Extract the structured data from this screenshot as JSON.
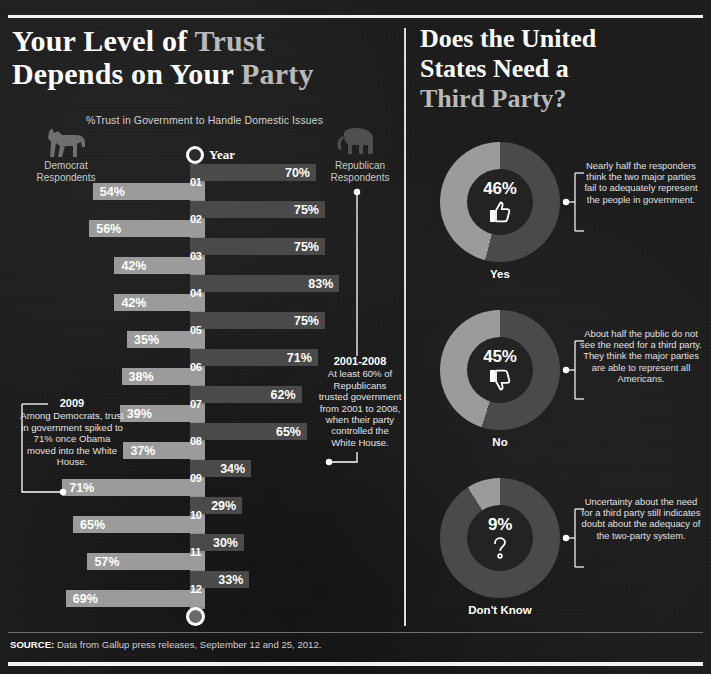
{
  "left_panel": {
    "title_line1_a": "Your Level of ",
    "title_line1_b": "Trust",
    "title_line2_a": "Depends on Your ",
    "title_line2_b": "Party",
    "subtitle": "%Trust in Government to Handle Domestic Issues",
    "year_axis_label": "Year",
    "democrat_label": "Democrat\nRespondents",
    "democrat_label_l1": "Democrat",
    "democrat_label_l2": "Respondents",
    "republican_label_l1": "Republican",
    "republican_label_l2": "Respondents",
    "donkey_icon": "donkey-icon",
    "elephant_icon": "elephant-icon",
    "callout_2009": {
      "heading": "2009",
      "body": "Among Democrats, trust in government spiked to 71% once Obama moved into the White House."
    },
    "callout_2001_2008": {
      "heading": "2001-2008",
      "body": "At least 60% of Republicans trusted government from 2001 to 2008, when their party controlled the White House."
    }
  },
  "right_panel": {
    "title_line1": "Does the United",
    "title_line2": "States Need a",
    "title_line3": "Third Party?",
    "donuts": [
      {
        "value": 9,
        "pct_label": "9%",
        "label": "Don't Know",
        "icon": "question-mark-icon",
        "note": "Uncertainty about the need for a third party still indicates doubt about the adequacy of the two-party system."
      }
    ]
  },
  "source": {
    "prefix": "SOURCE:",
    "text": " Data from Gallup press releases, September 12 and 25, 2012."
  },
  "colors": {
    "background": "#1c1c1c",
    "republican_bar": "#4a4a4a",
    "democrat_bar": "#9b9b9b",
    "axis_band": "#8d8d8d",
    "donut_active": "#9b9b9b",
    "donut_rest": "#4a4a4a",
    "rule": "#f2f2f2"
  },
  "chart_data": [
    {
      "type": "bar",
      "orientation": "horizontal-diverging",
      "title": "Your Level of Trust Depends on Your Party",
      "subtitle": "%Trust in Government to Handle Domestic Issues",
      "xlabel": "",
      "ylabel": "Year",
      "categories": [
        "01",
        "02",
        "03",
        "04",
        "05",
        "06",
        "07",
        "08",
        "09",
        "10",
        "11",
        "12"
      ],
      "category_full": [
        "2001",
        "2002",
        "2003",
        "2004",
        "2005",
        "2006",
        "2007",
        "2008",
        "2009",
        "2010",
        "2011",
        "2012"
      ],
      "unit": "%",
      "xlim": [
        0,
        100
      ],
      "grid": false,
      "legend_position": "top",
      "series": [
        {
          "name": "Republican Respondents",
          "direction": "right",
          "color": "#4a4a4a",
          "values": [
            70,
            75,
            75,
            83,
            75,
            71,
            62,
            65,
            34,
            29,
            30,
            33
          ],
          "labels": [
            "70%",
            "75%",
            "75%",
            "83%",
            "75%",
            "71%",
            "62%",
            "65%",
            "34%",
            "29%",
            "30%",
            "33%"
          ]
        },
        {
          "name": "Democrat Respondents",
          "direction": "left",
          "color": "#9b9b9b",
          "values": [
            54,
            56,
            42,
            42,
            35,
            38,
            39,
            37,
            71,
            65,
            57,
            69
          ],
          "labels": [
            "54%",
            "56%",
            "42%",
            "42%",
            "35%",
            "38%",
            "39%",
            "37%",
            "71%",
            "65%",
            "57%",
            "69%"
          ]
        }
      ],
      "annotations": [
        {
          "heading": "2009",
          "text": "Among Democrats, trust in government spiked to 71% once Obama moved into the White House.",
          "target_series": "Democrat Respondents",
          "target_category": "09"
        },
        {
          "heading": "2001-2008",
          "text": "At least 60% of Republicans trusted government from 2001 to 2008, when their party controlled the White House.",
          "target_series": "Republican Respondents",
          "target_category": "01-08"
        }
      ]
    },
    {
      "type": "pie",
      "subtype": "donut",
      "title": "Does the United States Need a Third Party?",
      "labels": [
        "Yes",
        "No",
        "Don't Know"
      ],
      "values": [
        46,
        45,
        9
      ],
      "value_labels": [
        "46%",
        "45%",
        "9%"
      ],
      "unit": "%",
      "legend_position": "below-each",
      "slices": [
        {
          "label": "Yes",
          "value": 46,
          "value_label": "46%",
          "icon": "thumbs-up-icon",
          "note": "Nearly half the responders think the two major parties fail to adequately represent the people in government."
        },
        {
          "label": "No",
          "value": 45,
          "value_label": "45%",
          "icon": "thumbs-down-icon",
          "note": "About half the public do not see the need for a third party. They think the major parties are able to represent all Americans."
        },
        {
          "label": "Don't Know",
          "value": 9,
          "value_label": "9%",
          "icon": "question-mark-icon",
          "note": "Uncertainty about the need for a third party still indicates doubt about the adequacy of the two-party system."
        }
      ]
    }
  ]
}
